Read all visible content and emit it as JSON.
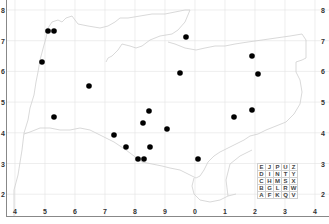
{
  "map": {
    "title": "",
    "x_axis_labels": [
      "4",
      "5",
      "6",
      "7",
      "8",
      "9",
      "0",
      "1",
      "2",
      "3",
      "4"
    ],
    "y_axis_labels": [
      "8",
      "7",
      "6",
      "5",
      "4",
      "3",
      "2"
    ],
    "colors": {
      "gridline": "#e2e2e2",
      "coastline": "#cccccc",
      "point": "#000000",
      "axis": "#888888",
      "label": "#333333"
    },
    "letter_grid": [
      [
        "E",
        "J",
        "P",
        "U",
        "Z"
      ],
      [
        "D",
        "I",
        "N",
        "T",
        "Y"
      ],
      [
        "C",
        "H",
        "M",
        "S",
        "X"
      ],
      [
        "B",
        "G",
        "L",
        "R",
        "W"
      ],
      [
        "A",
        "F",
        "K",
        "Q",
        "V"
      ]
    ]
  },
  "chart_data": {
    "type": "scatter",
    "title": "",
    "xlabel": "",
    "ylabel": "",
    "x_tick_labels": [
      "4",
      "5",
      "6",
      "7",
      "8",
      "9",
      "0",
      "1",
      "2",
      "3",
      "4"
    ],
    "y_tick_labels": [
      "2",
      "3",
      "4",
      "5",
      "6",
      "7",
      "8"
    ],
    "grid": true,
    "legend": [
      [
        "E",
        "J",
        "P",
        "U",
        "Z"
      ],
      [
        "D",
        "I",
        "N",
        "T",
        "Y"
      ],
      [
        "C",
        "H",
        "M",
        "S",
        "X"
      ],
      [
        "B",
        "G",
        "L",
        "R",
        "W"
      ],
      [
        "A",
        "F",
        "K",
        "Q",
        "V"
      ]
    ],
    "points_px": [
      {
        "x": 48,
        "y": 31
      },
      {
        "x": 54,
        "y": 31
      },
      {
        "x": 42,
        "y": 62
      },
      {
        "x": 89,
        "y": 86
      },
      {
        "x": 54,
        "y": 117
      },
      {
        "x": 186,
        "y": 37
      },
      {
        "x": 252,
        "y": 56
      },
      {
        "x": 180,
        "y": 73
      },
      {
        "x": 258,
        "y": 74
      },
      {
        "x": 252,
        "y": 110
      },
      {
        "x": 234,
        "y": 117
      },
      {
        "x": 149,
        "y": 111
      },
      {
        "x": 143,
        "y": 123
      },
      {
        "x": 167,
        "y": 129
      },
      {
        "x": 114,
        "y": 135
      },
      {
        "x": 126,
        "y": 147
      },
      {
        "x": 150,
        "y": 147
      },
      {
        "x": 138,
        "y": 159
      },
      {
        "x": 144,
        "y": 159
      },
      {
        "x": 198,
        "y": 159
      }
    ],
    "points_grid": [
      {
        "x": 5.1,
        "y": 7.3
      },
      {
        "x": 5.3,
        "y": 7.3
      },
      {
        "x": 4.9,
        "y": 6.3
      },
      {
        "x": 6.5,
        "y": 5.5
      },
      {
        "x": 5.3,
        "y": 4.5
      },
      {
        "x": 9.7,
        "y": 7.1
      },
      {
        "x": 1.9,
        "y": 6.5
      },
      {
        "x": 9.5,
        "y": 5.9
      },
      {
        "x": 2.1,
        "y": 5.9
      },
      {
        "x": 1.9,
        "y": 4.7
      },
      {
        "x": 1.3,
        "y": 4.5
      },
      {
        "x": 8.5,
        "y": 4.7
      },
      {
        "x": 8.3,
        "y": 4.3
      },
      {
        "x": 9.1,
        "y": 4.1
      },
      {
        "x": 7.3,
        "y": 3.9
      },
      {
        "x": 7.7,
        "y": 3.5
      },
      {
        "x": 8.5,
        "y": 3.5
      },
      {
        "x": 8.1,
        "y": 3.1
      },
      {
        "x": 8.3,
        "y": 3.1
      },
      {
        "x": 0.1,
        "y": 3.1
      }
    ]
  }
}
